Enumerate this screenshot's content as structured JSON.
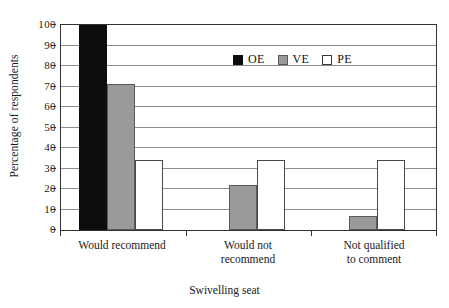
{
  "chart_data": {
    "type": "bar",
    "title": "",
    "xlabel": "Swivelling seat",
    "ylabel": "Percentage of respondents",
    "categories": [
      "Would recommend",
      "Would not recommend",
      "Not qualified to comment"
    ],
    "category_lines": [
      [
        "Would recommend"
      ],
      [
        "Would not",
        "recommend"
      ],
      [
        "Not qualified",
        "to comment"
      ]
    ],
    "series": [
      {
        "name": "OE",
        "color": "#0d0d0d",
        "values": [
          100,
          0,
          0
        ]
      },
      {
        "name": "VE",
        "color": "#9a9a9a",
        "values": [
          71,
          22,
          7
        ]
      },
      {
        "name": "PE",
        "color": "#ffffff",
        "values": [
          34,
          34,
          34
        ]
      }
    ],
    "ylim": [
      0,
      100
    ],
    "yticks": [
      0,
      10,
      20,
      30,
      40,
      50,
      60,
      70,
      80,
      90,
      100
    ],
    "ytick_labels": [
      "0",
      "10",
      "20",
      "30",
      "40",
      "50",
      "60",
      "70",
      "80",
      "90",
      "100"
    ],
    "grid": true,
    "legend_position": "top-center"
  },
  "legend": {
    "entries": [
      {
        "label": "OE",
        "swatch": "black-square-icon"
      },
      {
        "label": "VE",
        "swatch": "gray-square-icon"
      },
      {
        "label": "PE",
        "swatch": "white-square-icon"
      }
    ]
  },
  "colors": {
    "series_oe": "#0d0d0d",
    "series_ve": "#9a9a9a",
    "series_pe": "#ffffff",
    "gridline": "#8c8c8c",
    "axis": "#333333",
    "text": "#1a1a1a",
    "background": "#ffffff"
  }
}
